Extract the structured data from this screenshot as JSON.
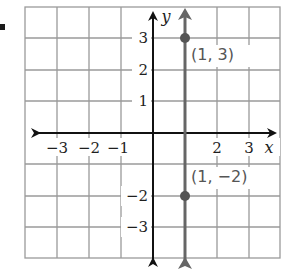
{
  "graph": {
    "axis_labels": {
      "x": "x",
      "y": "y"
    },
    "x_ticks": [
      {
        "value": -3,
        "label": "−3"
      },
      {
        "value": -2,
        "label": "−2"
      },
      {
        "value": -1,
        "label": "−1"
      },
      {
        "value": 2,
        "label": "2"
      },
      {
        "value": 3,
        "label": "3"
      }
    ],
    "y_ticks": [
      {
        "value": 3,
        "label": "3"
      },
      {
        "value": 2,
        "label": "2"
      },
      {
        "value": 1,
        "label": "1"
      },
      {
        "value": -2,
        "label": "−2"
      },
      {
        "value": -3,
        "label": "−3"
      }
    ],
    "points": [
      {
        "x": 1,
        "y": 3,
        "label": "(1, 3)"
      },
      {
        "x": 1,
        "y": -2,
        "label": "(1, −2)"
      }
    ],
    "line": {
      "type": "vertical",
      "equation": "x = 1"
    },
    "colors": {
      "grid": "#9a9a9a",
      "axes": "#111111",
      "line": "#666666",
      "points": "#555555"
    }
  }
}
